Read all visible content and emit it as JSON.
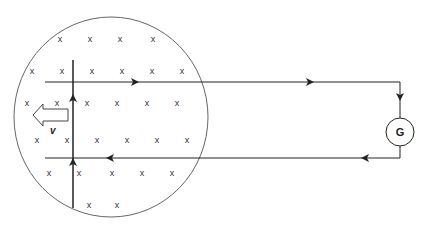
{
  "diagram": {
    "type": "electromagnetic-induction",
    "field_region": {
      "shape": "circle",
      "center": [
        111,
        117
      ],
      "rx": 97,
      "ry": 100,
      "stroke": "#555555",
      "field_symbol": "x",
      "field_marks": [
        [
          60,
          40
        ],
        [
          90,
          40
        ],
        [
          120,
          40
        ],
        [
          153,
          40
        ],
        [
          32,
          72
        ],
        [
          62,
          72
        ],
        [
          92,
          72
        ],
        [
          122,
          72
        ],
        [
          152,
          72
        ],
        [
          182,
          72
        ],
        [
          27,
          104
        ],
        [
          57,
          104
        ],
        [
          87,
          104
        ],
        [
          117,
          104
        ],
        [
          147,
          104
        ],
        [
          177,
          104
        ],
        [
          37,
          141
        ],
        [
          67,
          141
        ],
        [
          97,
          141
        ],
        [
          127,
          141
        ],
        [
          157,
          141
        ],
        [
          187,
          141
        ],
        [
          49,
          174
        ],
        [
          79,
          174
        ],
        [
          112,
          174
        ],
        [
          142,
          174
        ],
        [
          172,
          174
        ],
        [
          89,
          206
        ],
        [
          117,
          206
        ]
      ]
    },
    "circuit": {
      "top_rail": {
        "y": 82,
        "x1": 45,
        "x2": 400,
        "arrows_x": [
          135,
          310
        ],
        "direction": "right"
      },
      "right_side": {
        "x": 400,
        "y1": 82,
        "y2": 158,
        "arrow_y": 97,
        "direction": "down"
      },
      "bottom_rail": {
        "y": 158,
        "x1": 45,
        "x2": 400,
        "arrows_x": [
          110,
          365
        ],
        "direction": "left"
      },
      "galvanometer": {
        "label": "G",
        "center": [
          400,
          132
        ],
        "r": 14
      }
    },
    "rod": {
      "x": 73,
      "y1": 60,
      "y2": 208,
      "arrows_y": [
        98,
        162
      ],
      "current_direction": "up"
    },
    "velocity": {
      "label": "v",
      "direction": "left",
      "label_pos": [
        53,
        131
      ]
    },
    "colors": {
      "line": "#222222",
      "circle": "#666666",
      "background": "#ffffff"
    }
  }
}
